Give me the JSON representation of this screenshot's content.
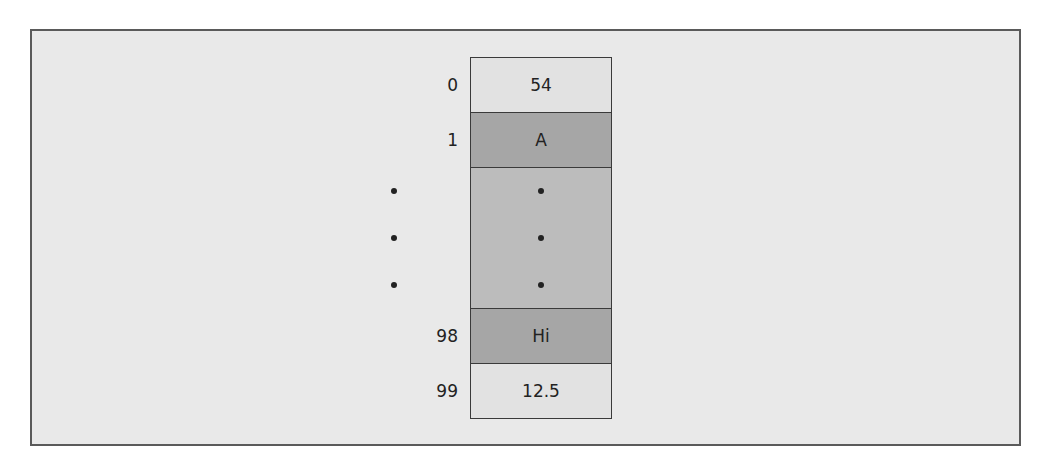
{
  "diagram": {
    "type": "array-memory-layout",
    "cells": [
      {
        "index": "0",
        "value": "54",
        "shade": "light"
      },
      {
        "index": "1",
        "value": "A",
        "shade": "dark"
      },
      {
        "index": "•",
        "value": "•",
        "shade": "mid",
        "ellipsis": true
      },
      {
        "index": "98",
        "value": "Hi",
        "shade": "dark"
      },
      {
        "index": "99",
        "value": "12.5",
        "shade": "light"
      }
    ],
    "colors": {
      "frame_border": "#5a5a5a",
      "frame_background": "#e9e9e9",
      "cell_light": "#e2e2e2",
      "cell_dark": "#a6a6a6",
      "cell_mid": "#bcbcbc",
      "cell_border": "#3a3a3a"
    }
  }
}
